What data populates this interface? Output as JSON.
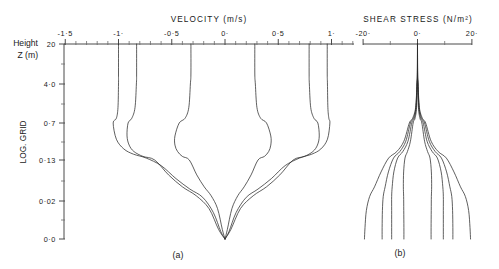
{
  "figure": {
    "panels": [
      {
        "id": "a",
        "label": "(a)"
      },
      {
        "id": "b",
        "label": "(b)"
      }
    ]
  },
  "y_axis": {
    "corner_label_line1": "Height",
    "corner_label_line2": "Z (m)",
    "axis_name": "LOG. GRID",
    "tick_labels": [
      "20",
      "4·0",
      "0·7",
      "0·13",
      "0·02",
      "0·0"
    ],
    "tick_values": [
      20,
      4.0,
      0.7,
      0.13,
      0.02,
      0.0
    ],
    "tick_y_px": [
      44,
      84,
      123,
      160,
      201,
      239
    ],
    "minor_tick_y_px": [
      64,
      104,
      142,
      181,
      220
    ]
  },
  "chart_data": [
    {
      "type": "line",
      "panel": "a",
      "title": "VELOCITY (m/s)",
      "xlabel": "VELOCITY (m/s)",
      "ylabel": "LOG. GRID",
      "y_axis_name": "Height Z (m)",
      "xlim": [
        -1.62,
        1.12
      ],
      "xticks": [
        -1.5,
        -1.0,
        -0.5,
        0.0,
        0.5,
        1.0
      ],
      "xtick_labels": [
        "-1·5",
        "-1·",
        "-0·5",
        "0·",
        "0·5",
        "1·"
      ],
      "ylim_log_grid": [
        0.0,
        20
      ],
      "grid": false,
      "legend": null,
      "description": "Six velocity profiles through a tidal cycle; all converge to u=0 at the bed (z=0) and reach free-stream values at z=20 m.",
      "series": [
        {
          "name": "profile-1",
          "surface_velocity": -1.0,
          "max_velocity": -1.0,
          "mid_bulge": -1.0,
          "points": [
            [
              -1.0,
              20
            ],
            [
              -1.0,
              8.0
            ],
            [
              -1.0,
              4.0
            ],
            [
              -1.005,
              2.0
            ],
            [
              -1.02,
              1.1
            ],
            [
              -1.05,
              0.7
            ],
            [
              -1.02,
              0.45
            ],
            [
              -0.95,
              0.3
            ],
            [
              -0.86,
              0.22
            ],
            [
              -0.74,
              0.16
            ],
            [
              -0.6,
              0.115
            ],
            [
              -0.46,
              0.08
            ],
            [
              -0.33,
              0.052
            ],
            [
              -0.21,
              0.03
            ],
            [
              -0.11,
              0.014
            ],
            [
              -0.04,
              0.004
            ],
            [
              0.0,
              0.0
            ]
          ]
        },
        {
          "name": "profile-2",
          "surface_velocity": -0.83,
          "max_velocity": -0.92,
          "mid_bulge": -0.92,
          "points": [
            [
              -0.83,
              20
            ],
            [
              -0.83,
              8.0
            ],
            [
              -0.832,
              4.0
            ],
            [
              -0.845,
              2.0
            ],
            [
              -0.875,
              1.1
            ],
            [
              -0.91,
              0.7
            ],
            [
              -0.92,
              0.5
            ],
            [
              -0.9,
              0.36
            ],
            [
              -0.855,
              0.26
            ],
            [
              -0.77,
              0.185
            ],
            [
              -0.66,
              0.13
            ],
            [
              -0.53,
              0.09
            ],
            [
              -0.4,
              0.058
            ],
            [
              -0.27,
              0.034
            ],
            [
              -0.15,
              0.016
            ],
            [
              -0.06,
              0.005
            ],
            [
              0.0,
              0.0
            ]
          ]
        },
        {
          "name": "profile-3",
          "surface_velocity": -0.32,
          "max_velocity": -0.47,
          "mid_bulge": -0.47,
          "points": [
            [
              -0.32,
              20
            ],
            [
              -0.32,
              8.0
            ],
            [
              -0.325,
              4.0
            ],
            [
              -0.34,
              2.0
            ],
            [
              -0.375,
              1.1
            ],
            [
              -0.43,
              0.7
            ],
            [
              -0.47,
              0.5
            ],
            [
              -0.47,
              0.36
            ],
            [
              -0.445,
              0.26
            ],
            [
              -0.4,
              0.185
            ],
            [
              -0.335,
              0.13
            ],
            [
              -0.265,
              0.09
            ],
            [
              -0.195,
              0.058
            ],
            [
              -0.13,
              0.034
            ],
            [
              -0.07,
              0.016
            ],
            [
              -0.025,
              0.005
            ],
            [
              0.0,
              0.0
            ]
          ]
        },
        {
          "name": "profile-4",
          "surface_velocity": 0.28,
          "max_velocity": 0.43,
          "mid_bulge": 0.43,
          "points": [
            [
              0.28,
              20
            ],
            [
              0.28,
              8.0
            ],
            [
              0.285,
              4.0
            ],
            [
              0.3,
              2.0
            ],
            [
              0.335,
              1.1
            ],
            [
              0.39,
              0.7
            ],
            [
              0.43,
              0.5
            ],
            [
              0.43,
              0.36
            ],
            [
              0.41,
              0.26
            ],
            [
              0.37,
              0.185
            ],
            [
              0.31,
              0.13
            ],
            [
              0.245,
              0.09
            ],
            [
              0.18,
              0.058
            ],
            [
              0.12,
              0.034
            ],
            [
              0.065,
              0.016
            ],
            [
              0.022,
              0.005
            ],
            [
              0.0,
              0.0
            ]
          ]
        },
        {
          "name": "profile-5",
          "surface_velocity": 0.79,
          "max_velocity": 0.885,
          "mid_bulge": 0.885,
          "points": [
            [
              0.79,
              20
            ],
            [
              0.79,
              8.0
            ],
            [
              0.792,
              4.0
            ],
            [
              0.805,
              2.0
            ],
            [
              0.835,
              1.1
            ],
            [
              0.872,
              0.7
            ],
            [
              0.885,
              0.5
            ],
            [
              0.868,
              0.36
            ],
            [
              0.825,
              0.26
            ],
            [
              0.745,
              0.185
            ],
            [
              0.64,
              0.13
            ],
            [
              0.515,
              0.09
            ],
            [
              0.39,
              0.058
            ],
            [
              0.265,
              0.034
            ],
            [
              0.145,
              0.016
            ],
            [
              0.055,
              0.005
            ],
            [
              0.0,
              0.0
            ]
          ]
        },
        {
          "name": "profile-6",
          "surface_velocity": 0.96,
          "max_velocity": 0.985,
          "mid_bulge": 0.985,
          "points": [
            [
              0.96,
              20
            ],
            [
              0.96,
              8.0
            ],
            [
              0.962,
              4.0
            ],
            [
              0.966,
              2.0
            ],
            [
              0.975,
              1.1
            ],
            [
              0.985,
              0.7
            ],
            [
              0.962,
              0.45
            ],
            [
              0.9,
              0.3
            ],
            [
              0.815,
              0.22
            ],
            [
              0.7,
              0.16
            ],
            [
              0.565,
              0.115
            ],
            [
              0.435,
              0.08
            ],
            [
              0.31,
              0.052
            ],
            [
              0.2,
              0.03
            ],
            [
              0.105,
              0.014
            ],
            [
              0.038,
              0.004
            ],
            [
              0.0,
              0.0
            ]
          ]
        }
      ]
    },
    {
      "type": "line",
      "panel": "b",
      "title": "SHEAR STRESS (N/m²)",
      "xlabel": "SHEAR STRESS (N/m²)",
      "ylabel": "LOG. GRID",
      "xlim": [
        -24.5,
        24.5
      ],
      "xticks": [
        -20,
        0,
        20
      ],
      "xtick_labels": [
        "-20·",
        "0·",
        "20·"
      ],
      "ylim_log_grid": [
        0.0,
        20
      ],
      "grid": false,
      "legend": null,
      "description": "Six shear-stress profiles; stress is near zero at the surface (z=20 m) and grows to a maximum magnitude at the bed, curves crossing each other in the lower half.",
      "series": [
        {
          "name": "stress-1",
          "bed_stress": -19.5,
          "points": [
            [
              0.0,
              20
            ],
            [
              -0.05,
              8.0
            ],
            [
              -0.2,
              4.0
            ],
            [
              -0.7,
              2.0
            ],
            [
              -1.8,
              1.1
            ],
            [
              -3.0,
              0.7
            ],
            [
              -5.0,
              0.42
            ],
            [
              -7.6,
              0.26
            ],
            [
              -10.6,
              0.16
            ],
            [
              -13.4,
              0.098
            ],
            [
              -15.8,
              0.058
            ],
            [
              -17.6,
              0.032
            ],
            [
              -18.8,
              0.015
            ],
            [
              -19.3,
              0.006
            ],
            [
              -19.5,
              0.0
            ]
          ]
        },
        {
          "name": "stress-2",
          "bed_stress": -13.0,
          "points": [
            [
              0.0,
              20
            ],
            [
              -0.04,
              8.0
            ],
            [
              -0.18,
              4.0
            ],
            [
              -0.6,
              2.0
            ],
            [
              -1.5,
              1.1
            ],
            [
              -2.6,
              0.7
            ],
            [
              -4.3,
              0.42
            ],
            [
              -6.5,
              0.26
            ],
            [
              -8.8,
              0.16
            ],
            [
              -10.7,
              0.098
            ],
            [
              -11.9,
              0.058
            ],
            [
              -12.6,
              0.032
            ],
            [
              -12.9,
              0.015
            ],
            [
              -13.0,
              0.006
            ],
            [
              -13.0,
              0.0
            ]
          ],
          "crossing": true
        },
        {
          "name": "stress-3",
          "bed_stress": -5.0,
          "points": [
            [
              0.0,
              20
            ],
            [
              -0.02,
              8.0
            ],
            [
              -0.1,
              4.0
            ],
            [
              -0.35,
              2.0
            ],
            [
              -0.9,
              1.1
            ],
            [
              -1.6,
              0.7
            ],
            [
              -2.6,
              0.42
            ],
            [
              -3.7,
              0.26
            ],
            [
              -4.6,
              0.16
            ],
            [
              -5.1,
              0.098
            ],
            [
              -5.2,
              0.058
            ],
            [
              -5.1,
              0.032
            ],
            [
              -5.05,
              0.015
            ],
            [
              -5.0,
              0.006
            ],
            [
              -5.0,
              0.0
            ]
          ]
        },
        {
          "name": "stress-4",
          "bed_stress": 5.0,
          "points": [
            [
              0.0,
              20
            ],
            [
              0.02,
              8.0
            ],
            [
              0.1,
              4.0
            ],
            [
              0.35,
              2.0
            ],
            [
              0.9,
              1.1
            ],
            [
              1.6,
              0.7
            ],
            [
              2.6,
              0.42
            ],
            [
              3.7,
              0.26
            ],
            [
              4.6,
              0.16
            ],
            [
              5.1,
              0.098
            ],
            [
              5.2,
              0.058
            ],
            [
              5.1,
              0.032
            ],
            [
              5.05,
              0.015
            ],
            [
              5.0,
              0.006
            ],
            [
              5.0,
              0.0
            ]
          ]
        },
        {
          "name": "stress-5",
          "bed_stress": 13.0,
          "points": [
            [
              0.0,
              20
            ],
            [
              0.04,
              8.0
            ],
            [
              0.18,
              4.0
            ],
            [
              0.6,
              2.0
            ],
            [
              1.5,
              1.1
            ],
            [
              2.6,
              0.7
            ],
            [
              4.3,
              0.42
            ],
            [
              6.5,
              0.26
            ],
            [
              8.8,
              0.16
            ],
            [
              10.7,
              0.098
            ],
            [
              11.9,
              0.058
            ],
            [
              12.6,
              0.032
            ],
            [
              12.9,
              0.015
            ],
            [
              13.0,
              0.006
            ],
            [
              13.0,
              0.0
            ]
          ],
          "crossing": true
        },
        {
          "name": "stress-6",
          "bed_stress": 19.5,
          "points": [
            [
              0.0,
              20
            ],
            [
              0.05,
              8.0
            ],
            [
              0.2,
              4.0
            ],
            [
              0.7,
              2.0
            ],
            [
              1.8,
              1.1
            ],
            [
              3.0,
              0.7
            ],
            [
              5.0,
              0.42
            ],
            [
              7.6,
              0.26
            ],
            [
              10.6,
              0.16
            ],
            [
              13.4,
              0.098
            ],
            [
              15.8,
              0.058
            ],
            [
              17.6,
              0.032
            ],
            [
              18.8,
              0.015
            ],
            [
              19.3,
              0.006
            ],
            [
              19.5,
              0.0
            ]
          ]
        },
        {
          "name": "stress-7",
          "bed_stress": -9.5,
          "points": [
            [
              0.0,
              20
            ],
            [
              -0.03,
              8.0
            ],
            [
              -0.14,
              4.0
            ],
            [
              -0.5,
              2.0
            ],
            [
              -1.2,
              1.1
            ],
            [
              -2.1,
              0.7
            ],
            [
              -3.5,
              0.42
            ],
            [
              -5.4,
              0.26
            ],
            [
              -7.3,
              0.16
            ],
            [
              -8.7,
              0.098
            ],
            [
              -9.3,
              0.058
            ],
            [
              -9.5,
              0.032
            ],
            [
              -9.5,
              0.015
            ],
            [
              -9.5,
              0.006
            ],
            [
              -9.5,
              0.0
            ]
          ]
        },
        {
          "name": "stress-8",
          "bed_stress": 9.5,
          "points": [
            [
              0.0,
              20
            ],
            [
              0.03,
              8.0
            ],
            [
              0.14,
              4.0
            ],
            [
              0.5,
              2.0
            ],
            [
              1.2,
              1.1
            ],
            [
              2.1,
              0.7
            ],
            [
              3.5,
              0.42
            ],
            [
              5.4,
              0.26
            ],
            [
              7.3,
              0.16
            ],
            [
              8.7,
              0.098
            ],
            [
              9.3,
              0.058
            ],
            [
              9.5,
              0.032
            ],
            [
              9.5,
              0.015
            ],
            [
              9.5,
              0.006
            ],
            [
              9.5,
              0.0
            ]
          ]
        }
      ]
    }
  ],
  "geometry": {
    "panel_a": {
      "x_left_px": 64,
      "x_right_px": 354,
      "x_zero_px": 225,
      "px_per_unit": 106.5,
      "axis_y_px": 44,
      "bottom_y_px": 239
    },
    "panel_b": {
      "x_left_px": 363,
      "x_right_px": 472,
      "x_zero_px": 417.5,
      "px_per_unit": 2.72,
      "axis_y_px": 44,
      "bottom_y_px": 239
    },
    "y_axis_x_px": 64
  }
}
